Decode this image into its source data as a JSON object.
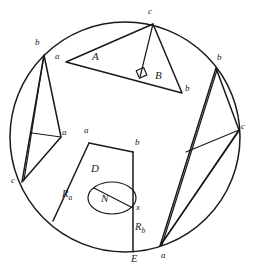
{
  "figure": {
    "kind": "geometry-diagram",
    "ink_color": "#1a1a1a",
    "background_color": "#ffffff"
  },
  "circle": {
    "name": "outer-circle",
    "cx": 125,
    "cy": 137,
    "rx": 115,
    "ry": 115
  },
  "top_triangle": {
    "name": "top-triangle",
    "vertices": [
      {
        "id": "a",
        "label": "a",
        "x": 66,
        "y": 62
      },
      {
        "id": "c",
        "label": "c",
        "x": 153,
        "y": 24
      },
      {
        "id": "b",
        "label": "b",
        "x": 182,
        "y": 93
      }
    ],
    "vertex_labels": [
      {
        "label": "a",
        "x": 57,
        "y": 57
      },
      {
        "label": "c",
        "x": 150,
        "y": 12
      },
      {
        "label": "b",
        "x": 186,
        "y": 89
      }
    ],
    "angle_labels": [
      {
        "label": "A",
        "x": 96,
        "y": 58
      },
      {
        "label": "B",
        "x": 158,
        "y": 76
      }
    ],
    "altitude": {
      "from": "c",
      "foot_x": 140,
      "foot_y": 77
    },
    "right_angle_marker": true
  },
  "left_triangle": {
    "name": "left-triangle",
    "vertices": [
      {
        "id": "b",
        "label": "b",
        "x": 44,
        "y": 55
      },
      {
        "id": "a",
        "label": "a",
        "x": 61,
        "y": 137
      },
      {
        "id": "c",
        "label": "c",
        "x": 22,
        "y": 182
      }
    ],
    "vertex_labels": [
      {
        "label": "b",
        "x": 38,
        "y": 44
      },
      {
        "label": "a",
        "x": 64,
        "y": 134
      },
      {
        "label": "c",
        "x": 14,
        "y": 182
      }
    ],
    "cevian": {
      "from_x": 32,
      "from_y": 133,
      "to_x": 61,
      "to_y": 137
    }
  },
  "right_triangle": {
    "name": "right-triangle",
    "vertices": [
      {
        "id": "b",
        "label": "b",
        "x": 216,
        "y": 68
      },
      {
        "id": "c",
        "label": "c",
        "x": 239,
        "y": 130
      },
      {
        "id": "a",
        "label": "a",
        "x": 160,
        "y": 246
      }
    ],
    "vertex_labels": [
      {
        "label": "b",
        "x": 219,
        "y": 60
      },
      {
        "label": "c",
        "x": 242,
        "y": 128
      },
      {
        "label": "a",
        "x": 162,
        "y": 257
      }
    ],
    "cevian": {
      "from_x": 186,
      "from_y": 152,
      "to_x": 239,
      "to_y": 130
    }
  },
  "center_region": {
    "name": "center-quadrilateral",
    "corners": [
      {
        "id": "a",
        "label": "a",
        "x": 89,
        "y": 143
      },
      {
        "id": "b",
        "label": "b",
        "x": 133,
        "y": 152
      },
      {
        "id": "E",
        "label": "E",
        "x": 133,
        "y": 252
      },
      {
        "id": "Ra_end",
        "label": "",
        "x": 53,
        "y": 221
      }
    ],
    "labels": [
      {
        "id": "a",
        "label": "a",
        "x": 85,
        "y": 132
      },
      {
        "id": "b",
        "label": "b",
        "x": 136,
        "y": 144
      },
      {
        "id": "D",
        "label": "D",
        "x": 94,
        "y": 170
      },
      {
        "id": "N",
        "label": "N",
        "x": 104,
        "y": 200
      },
      {
        "id": "x",
        "label": "x",
        "x": 136,
        "y": 208
      },
      {
        "id": "E",
        "label": "E",
        "x": 134,
        "y": 259
      }
    ],
    "radius_labels": [
      {
        "id": "Ra",
        "base": "R",
        "sub": "a",
        "x": 64,
        "y": 195
      },
      {
        "id": "Rb",
        "base": "R",
        "sub": "b",
        "x": 136,
        "y": 228
      }
    ],
    "ellipse": {
      "name": "inner-ellipse",
      "cx": 112,
      "cy": 198,
      "rx": 24,
      "ry": 16,
      "chord": {
        "x1": 94,
        "y1": 188,
        "x2": 133,
        "y2": 208
      }
    },
    "point_x": {
      "x": 133,
      "y": 208
    }
  },
  "scan_artifact": {
    "name": "top-scan-noise",
    "text": ". . . ."
  }
}
